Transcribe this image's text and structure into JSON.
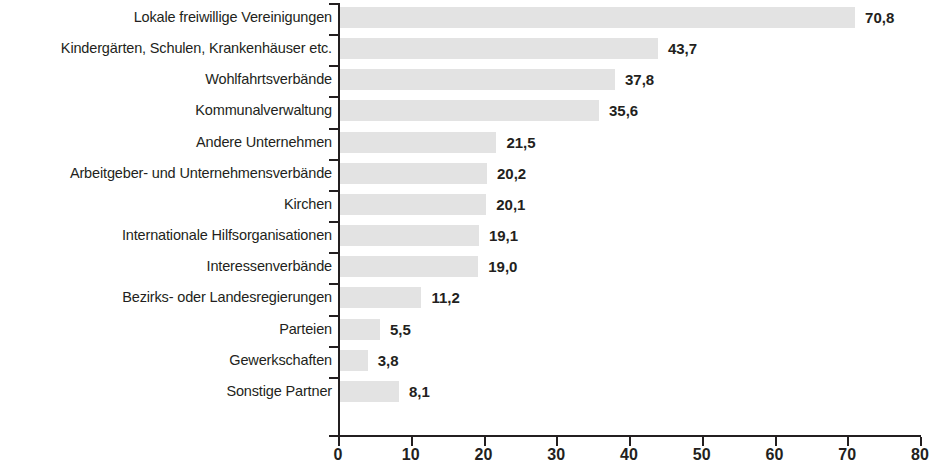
{
  "chart_data": {
    "type": "bar",
    "orientation": "horizontal",
    "title": "",
    "subtitle": "",
    "xlabel": "",
    "ylabel": "",
    "xlim": [
      0,
      80
    ],
    "xticks": [
      "0",
      "10",
      "20",
      "30",
      "40",
      "50",
      "60",
      "70",
      "80"
    ],
    "xtick_values": [
      0,
      10,
      20,
      30,
      40,
      50,
      60,
      70,
      80
    ],
    "grid": false,
    "legend": null,
    "bar_color": "#e3e3e3",
    "axis_color": "#231f20",
    "text_color": "#231f20",
    "decimal_separator": ",",
    "categories": [
      "Lokale freiwillige Vereinigungen",
      "Kindergärten, Schulen, Krankenhäuser etc.",
      "Wohlfahrtsverbände",
      "Kommunalverwaltung",
      "Andere Unternehmen",
      "Arbeitgeber- und Unternehmensverbände",
      "Kirchen",
      "Internationale Hilfsorganisationen",
      "Interessenverbände",
      "Bezirks- oder Landesregierungen",
      "Parteien",
      "Gewerkschaften",
      "Sonstige Partner"
    ],
    "values": [
      70.8,
      43.7,
      37.8,
      35.6,
      21.5,
      20.2,
      20.1,
      19.1,
      19.0,
      11.2,
      5.5,
      3.8,
      8.1
    ],
    "value_labels": [
      "70,8",
      "43,7",
      "37,8",
      "35,6",
      "21,5",
      "20,2",
      "20,1",
      "19,1",
      "19,0",
      "11,2",
      "5,5",
      "3,8",
      "8,1"
    ]
  }
}
